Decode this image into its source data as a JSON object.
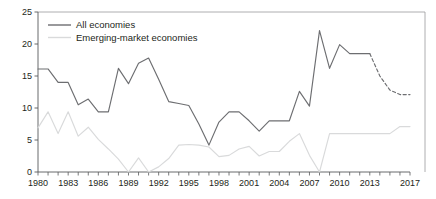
{
  "chart_data": {
    "type": "line",
    "title": "",
    "subtitle": "",
    "xlabel": "",
    "ylabel": "",
    "xlim": [
      1980,
      2017
    ],
    "ylim": [
      0,
      25
    ],
    "yticks": [
      0,
      5,
      10,
      15,
      20,
      25
    ],
    "xticks": [
      1980,
      1983,
      1986,
      1989,
      1992,
      1995,
      1998,
      2001,
      2004,
      2007,
      2010,
      2013,
      2017
    ],
    "x_tick_labels": [
      "1980",
      "1983",
      "1986",
      "1989",
      "1992",
      "1995",
      "1998",
      "2001",
      "2004",
      "2007",
      "2010",
      "2013",
      "2017"
    ],
    "y_tick_labels": [
      "0",
      "5",
      "10",
      "15",
      "20",
      "25"
    ],
    "grid": false,
    "legend_position": "top-left",
    "x": [
      1980,
      1981,
      1982,
      1983,
      1984,
      1985,
      1986,
      1987,
      1988,
      1989,
      1990,
      1991,
      1992,
      1993,
      1994,
      1995,
      1996,
      1997,
      1998,
      1999,
      2000,
      2001,
      2002,
      2003,
      2004,
      2005,
      2006,
      2007,
      2008,
      2009,
      2010,
      2011,
      2012,
      2013,
      2014,
      2015,
      2016,
      2017
    ],
    "series": [
      {
        "name": "All economies",
        "color": "#6d6e71",
        "style": "solid",
        "forecast_from": 2013,
        "forecast_style": "dashed",
        "values": [
          16.1,
          16.1,
          14.0,
          14.0,
          10.5,
          11.4,
          9.4,
          9.4,
          16.2,
          13.8,
          17.0,
          17.8,
          14.5,
          11.0,
          10.7,
          10.4,
          7.5,
          4.2,
          7.8,
          9.4,
          9.4,
          8.0,
          6.4,
          8.0,
          8.0,
          8.0,
          12.6,
          10.3,
          22.1,
          16.2,
          19.9,
          18.5,
          18.5,
          18.5,
          15.0,
          12.8,
          12.1,
          12.1
        ]
      },
      {
        "name": "Emerging-market economies",
        "color": "#d9dadb",
        "style": "solid",
        "values": [
          6.9,
          9.4,
          6.0,
          9.4,
          5.6,
          7.0,
          5.1,
          3.6,
          2.0,
          0.0,
          2.2,
          0.0,
          0.8,
          2.1,
          4.2,
          4.3,
          4.2,
          3.9,
          2.4,
          2.6,
          3.6,
          4.0,
          2.5,
          3.2,
          3.2,
          4.8,
          6.0,
          2.6,
          0.0,
          6.0,
          6.0,
          6.0,
          6.0,
          6.0,
          6.0,
          6.0,
          7.1,
          7.1
        ]
      }
    ]
  },
  "legend": {
    "items": [
      {
        "label": "All economies",
        "color": "#6d6e71"
      },
      {
        "label": "Emerging-market economies",
        "color": "#d9dadb"
      }
    ]
  },
  "axis": {
    "y_values": [
      "25",
      "20",
      "15",
      "10",
      "5",
      "0"
    ],
    "x_values": [
      "1980",
      "1983",
      "1986",
      "1989",
      "1992",
      "1995",
      "1998",
      "2001",
      "2004",
      "2007",
      "2010",
      "2013",
      "2017"
    ]
  }
}
